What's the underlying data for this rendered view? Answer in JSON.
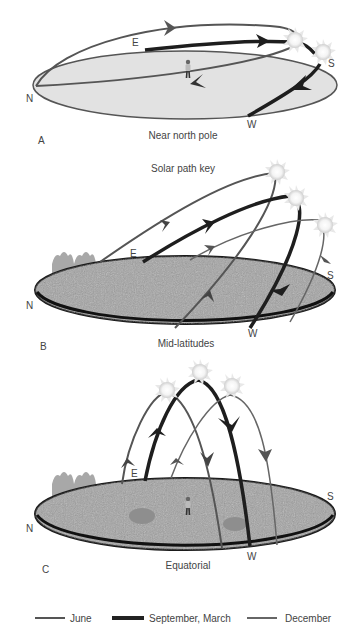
{
  "panels": {
    "a": {
      "letter": "A",
      "caption": "Near north pole",
      "directions": {
        "n": "N",
        "e": "E",
        "s": "S",
        "w": "W"
      }
    },
    "b": {
      "letter": "B",
      "title": "Solar path key",
      "caption": "Mid-latitudes",
      "directions": {
        "n": "N",
        "e": "E",
        "s": "S",
        "w": "W"
      }
    },
    "c": {
      "letter": "C",
      "caption": "Equatorial",
      "directions": {
        "n": "N",
        "e": "E",
        "s": "S",
        "w": "W"
      }
    }
  },
  "legend": [
    {
      "label": "June",
      "style": "medium",
      "color": "#555555"
    },
    {
      "label": "September, March",
      "style": "thick",
      "color": "#222222"
    },
    {
      "label": "December",
      "style": "thin",
      "color": "#666666"
    }
  ],
  "colors": {
    "polar_ground": "#e4e4e4",
    "ground_texture": "#9a9a9a",
    "ground_edge": "#1a1a1a",
    "path_june": "#555555",
    "path_equinox": "#1e1e1e",
    "path_december": "#6a6a6a"
  }
}
